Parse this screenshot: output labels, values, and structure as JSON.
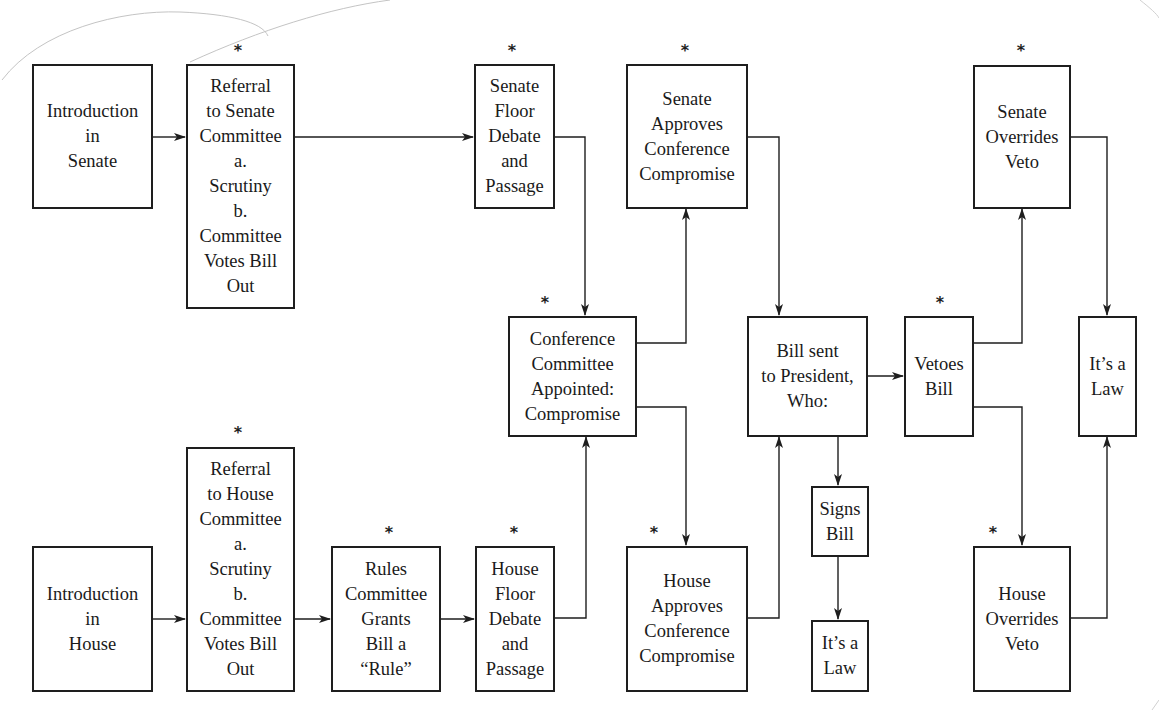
{
  "diagram": {
    "marker_symbol": "*",
    "colors": {
      "line": "#1e1e1e",
      "background": "#ffffff",
      "pencil_mark": "#bdbdbd"
    },
    "nodes": {
      "intro_senate": {
        "lines": [
          "Introduction",
          "in",
          "Senate"
        ],
        "starred": false
      },
      "referral_senate": {
        "lines": [
          "Referral",
          "to Senate",
          "Committee",
          "a.",
          "Scrutiny",
          "b.",
          "Committee",
          "Votes Bill",
          "Out"
        ],
        "starred": true
      },
      "senate_floor": {
        "lines": [
          "Senate",
          "Floor",
          "Debate",
          "and",
          "Passage"
        ],
        "starred": true
      },
      "senate_approves": {
        "lines": [
          "Senate",
          "Approves",
          "Conference",
          "Compromise"
        ],
        "starred": true
      },
      "senate_overrides": {
        "lines": [
          "Senate",
          "Overrides",
          "Veto"
        ],
        "starred": true
      },
      "conference": {
        "lines": [
          "Conference",
          "Committee",
          "Appointed:",
          "Compromise"
        ],
        "starred": true
      },
      "bill_sent": {
        "lines": [
          "Bill sent",
          "to President,",
          "Who:"
        ],
        "starred": false
      },
      "vetoes": {
        "lines": [
          "Vetoes",
          "Bill"
        ],
        "starred": true
      },
      "law_right": {
        "lines": [
          "It’s a",
          "Law"
        ],
        "starred": false
      },
      "signs": {
        "lines": [
          "Signs",
          "Bill"
        ],
        "starred": false
      },
      "law_bottom": {
        "lines": [
          "It’s a",
          "Law"
        ],
        "starred": false
      },
      "intro_house": {
        "lines": [
          "Introduction",
          "in",
          "House"
        ],
        "starred": false
      },
      "referral_house": {
        "lines": [
          "Referral",
          "to House",
          "Committee",
          "a.",
          "Scrutiny",
          "b.",
          "Committee",
          "Votes Bill",
          "Out"
        ],
        "starred": true
      },
      "rules": {
        "lines": [
          "Rules",
          "Committee",
          "Grants",
          "Bill a",
          "“Rule”"
        ],
        "starred": true
      },
      "house_floor": {
        "lines": [
          "House",
          "Floor",
          "Debate",
          "and",
          "Passage"
        ],
        "starred": true
      },
      "house_approves": {
        "lines": [
          "House",
          "Approves",
          "Conference",
          "Compromise"
        ],
        "starred": true
      },
      "house_overrides": {
        "lines": [
          "House",
          "Overrides",
          "Veto"
        ],
        "starred": true
      }
    },
    "edges": [
      {
        "from": "intro_senate",
        "to": "referral_senate"
      },
      {
        "from": "referral_senate",
        "to": "senate_floor"
      },
      {
        "from": "senate_floor",
        "to": "conference"
      },
      {
        "from": "intro_house",
        "to": "referral_house"
      },
      {
        "from": "referral_house",
        "to": "rules"
      },
      {
        "from": "rules",
        "to": "house_floor"
      },
      {
        "from": "house_floor",
        "to": "conference"
      },
      {
        "from": "conference",
        "to": "senate_approves"
      },
      {
        "from": "conference",
        "to": "house_approves"
      },
      {
        "from": "senate_approves",
        "to": "bill_sent"
      },
      {
        "from": "house_approves",
        "to": "bill_sent"
      },
      {
        "from": "bill_sent",
        "to": "vetoes"
      },
      {
        "from": "bill_sent",
        "to": "signs"
      },
      {
        "from": "signs",
        "to": "law_bottom"
      },
      {
        "from": "vetoes",
        "to": "senate_overrides"
      },
      {
        "from": "vetoes",
        "to": "house_overrides"
      },
      {
        "from": "senate_overrides",
        "to": "law_right"
      },
      {
        "from": "house_overrides",
        "to": "law_right"
      }
    ]
  }
}
